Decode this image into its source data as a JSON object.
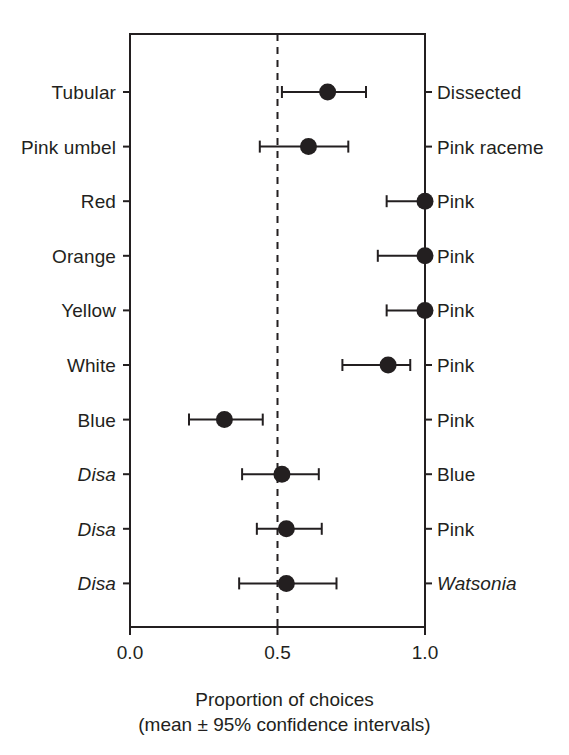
{
  "figure": {
    "background": "#ffffff",
    "ink_color": "#231f20"
  },
  "axis": {
    "xlabel_line1": "Proportion of choices",
    "xlabel_line2": "(mean ± 95% confidence intervals)",
    "tick_labels": [
      "0.0",
      "0.5",
      "1.0"
    ],
    "tick_values": [
      0.0,
      0.5,
      1.0
    ],
    "reference_line_value": 0.5,
    "reference_line_style": "dashed"
  },
  "chart_data": {
    "type": "scatter",
    "title": "",
    "xlabel": "Proportion of choices (mean ± 95% confidence intervals)",
    "ylabel": "",
    "xlim": [
      0.0,
      1.0
    ],
    "xticks": [
      0.0,
      0.5,
      1.0
    ],
    "xticklabels": [
      "0.0",
      "0.5",
      "1.0"
    ],
    "grid": false,
    "legend": "none",
    "reference_line": 0.5,
    "orientation": "horizontal",
    "error_bars": "95% confidence intervals",
    "categories": [
      "Tubular vs Dissected",
      "Pink umbel vs Pink raceme",
      "Red vs Pink",
      "Orange vs Pink",
      "Yellow vs Pink",
      "White vs Pink",
      "Blue vs Pink",
      "Disa vs Blue",
      "Disa vs Pink",
      "Disa vs Watsonia"
    ],
    "rows": [
      {
        "left_label": "Tubular",
        "left_italic": false,
        "right_label": "Dissected",
        "right_italic": false,
        "mean": 0.67,
        "ci_low": 0.515,
        "ci_high": 0.8
      },
      {
        "left_label": "Pink umbel",
        "left_italic": false,
        "right_label": "Pink raceme",
        "right_italic": false,
        "mean": 0.605,
        "ci_low": 0.44,
        "ci_high": 0.74
      },
      {
        "left_label": "Red",
        "left_italic": false,
        "right_label": "Pink",
        "right_italic": false,
        "mean": 1.0,
        "ci_low": 0.87,
        "ci_high": 1.0
      },
      {
        "left_label": "Orange",
        "left_italic": false,
        "right_label": "Pink",
        "right_italic": false,
        "mean": 1.0,
        "ci_low": 0.84,
        "ci_high": 1.0
      },
      {
        "left_label": "Yellow",
        "left_italic": false,
        "right_label": "Pink",
        "right_italic": false,
        "mean": 1.0,
        "ci_low": 0.87,
        "ci_high": 1.0
      },
      {
        "left_label": "White",
        "left_italic": false,
        "right_label": "Pink",
        "right_italic": false,
        "mean": 0.875,
        "ci_low": 0.72,
        "ci_high": 0.95
      },
      {
        "left_label": "Blue",
        "left_italic": false,
        "right_label": "Pink",
        "right_italic": false,
        "mean": 0.32,
        "ci_low": 0.2,
        "ci_high": 0.45
      },
      {
        "left_label": "Disa",
        "left_italic": true,
        "right_label": "Blue",
        "right_italic": false,
        "mean": 0.515,
        "ci_low": 0.38,
        "ci_high": 0.64
      },
      {
        "left_label": "Disa",
        "left_italic": true,
        "right_label": "Pink",
        "right_italic": false,
        "mean": 0.53,
        "ci_low": 0.43,
        "ci_high": 0.65
      },
      {
        "left_label": "Disa",
        "left_italic": true,
        "right_label": "Watsonia",
        "right_italic": true,
        "mean": 0.53,
        "ci_low": 0.37,
        "ci_high": 0.7
      }
    ]
  }
}
